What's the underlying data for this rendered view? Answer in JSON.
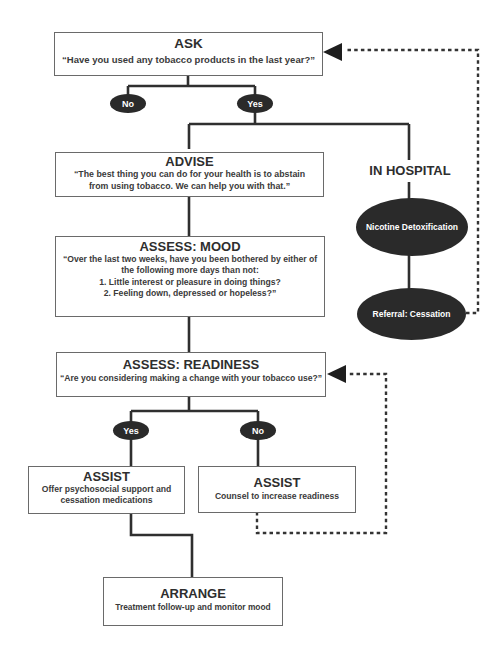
{
  "ask": {
    "title": "ASK",
    "question": "“Have you used any tobacco products in the last year?”",
    "no_label": "No",
    "yes_label": "Yes"
  },
  "advise": {
    "title": "ADVISE",
    "line1": "“The best thing you can do for your health is to abstain",
    "line2": "from using tobacco. We can help you with that.”"
  },
  "in_hospital": {
    "title": "IN HOSPITAL",
    "step1": "Nicotine Detoxification",
    "step2": "Referral: Cessation"
  },
  "assess_mood": {
    "title": "ASSESS: MOOD",
    "line1": "“Over the last two weeks, have you been bothered by either of",
    "line2": "the following more days than not:",
    "line3": "1. Little interest or pleasure in doing things?",
    "line4": "2. Feeling down, depressed or hopeless?”"
  },
  "assess_readiness": {
    "title": "ASSESS: READINESS",
    "question": "“Are you considering making a change with your tobacco use?”",
    "yes_label": "Yes",
    "no_label": "No"
  },
  "assist_yes": {
    "title": "ASSIST",
    "line1": "Offer psychosocial support and",
    "line2": "cessation medications"
  },
  "assist_no": {
    "title": "ASSIST",
    "line1": "Counsel to increase readiness"
  },
  "arrange": {
    "title": "ARRANGE",
    "line1": "Treatment follow-up and monitor mood"
  },
  "colors": {
    "line": "#2f2f2f",
    "oval_fill": "#2a2a2a",
    "box_border": "#6a6a6a"
  }
}
